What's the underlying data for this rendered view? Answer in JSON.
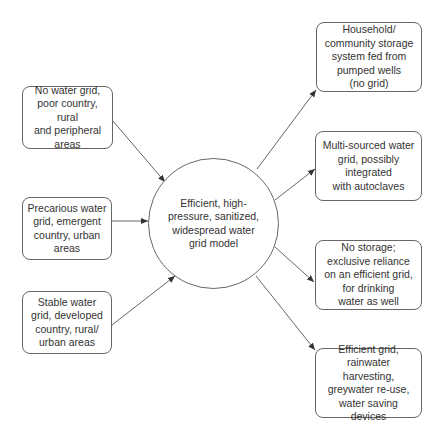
{
  "center": {
    "label": "Efficient, high-\npressure, sanitized,\nwidespread water\ngrid model"
  },
  "inputs": [
    {
      "label": "No water grid,\npoor country, rural\nand  peripheral\nareas"
    },
    {
      "label": "Precarious water\ngrid, emergent\ncountry, urban\nareas"
    },
    {
      "label": "Stable water\ngrid, developed\ncountry, rural/\nurban areas"
    }
  ],
  "outputs": [
    {
      "label": "Household/\ncommunity storage\nsystem fed from\npumped wells\n(no grid)"
    },
    {
      "label": "Multi-sourced water\ngrid, possibly\nintegrated\nwith autoclaves"
    },
    {
      "label": "No storage;\nexclusive reliance\non an efficient grid,\nfor drinking\nwater as well"
    },
    {
      "label": "Efficient grid,\nrainwater harvesting,\ngreywater re-use,\nwater saving devices"
    }
  ],
  "colors": {
    "stroke": "#666666",
    "text": "#333333",
    "background": "#ffffff"
  }
}
